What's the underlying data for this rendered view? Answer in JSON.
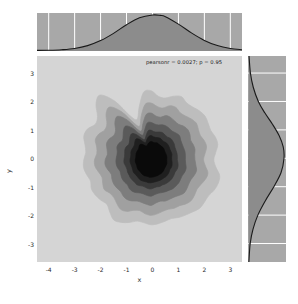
{
  "annotation": {
    "text": "pearsonr = 0.0027; p = 0.95",
    "pearson_r": 0.0027,
    "p_value": 0.95
  },
  "axis_titles": {
    "x": "x",
    "y": "y"
  },
  "watermark": {
    "text": ""
  },
  "colors": {
    "figure_background": "#ffffff",
    "axes_background": "#d5d5d5",
    "marginal_background": "#a8a8a8",
    "gridline": "#ffffff",
    "kde_line": "#1a1a1a",
    "kde_fill": "#8c8c8c",
    "tick_label": "#2b2b2b",
    "contour_levels": [
      "#d5d5d5",
      "#bdbdbd",
      "#a0a0a0",
      "#7d7d7d",
      "#5a5a5a",
      "#3a3a3a",
      "#1f1f1f",
      "#0a0a0a"
    ]
  },
  "chart_data": {
    "type": "contour",
    "title": "",
    "subtitle": "",
    "xlabel": "x",
    "ylabel": "y",
    "xlim": [
      -4.45,
      3.45
    ],
    "ylim": [
      -3.65,
      3.6
    ],
    "xticks": [
      -4,
      -3,
      -2,
      -1,
      0,
      1,
      2,
      3
    ],
    "xticklabels": [
      "-4",
      "-3",
      "-2",
      "-1",
      "0",
      "1",
      "2",
      "3"
    ],
    "yticks": [
      -3,
      -2,
      -1,
      0,
      1,
      2,
      3
    ],
    "yticklabels": [
      "-3",
      "-2",
      "-1",
      "0",
      "1",
      "2",
      "3"
    ],
    "grid": false,
    "legend": null,
    "annotations": [
      {
        "text": "pearsonr = 0.0027; p = 0.95",
        "x": 0.9,
        "y": 3.35,
        "halign": "center"
      }
    ],
    "joint": {
      "kind": "kde",
      "shade": true,
      "cmap": "Greys",
      "n_levels": 8,
      "center": {
        "x": -0.05,
        "y": -0.05
      },
      "contours": [
        {
          "level": 1,
          "color": "#bdbdbd",
          "radius_x": 2.55,
          "radius_y": 2.35,
          "lobes": [
            0.1,
            -0.06,
            0.12,
            -0.04,
            0.08,
            -0.1,
            0.06,
            -0.08,
            0.11,
            -0.05,
            0.09,
            -0.07
          ]
        },
        {
          "level": 2,
          "color": "#a0a0a0",
          "radius_x": 2.1,
          "radius_y": 1.95,
          "lobes": [
            0.09,
            -0.07,
            0.11,
            -0.05,
            0.07,
            -0.09,
            0.08,
            -0.06,
            0.1,
            -0.04,
            0.08,
            -0.08
          ]
        },
        {
          "level": 3,
          "color": "#7d7d7d",
          "radius_x": 1.7,
          "radius_y": 1.6,
          "lobes": [
            0.08,
            -0.06,
            0.1,
            -0.05,
            0.07,
            -0.08,
            0.09,
            -0.05,
            0.08,
            -0.06,
            0.07,
            -0.07
          ]
        },
        {
          "level": 4,
          "color": "#5a5a5a",
          "radius_x": 1.32,
          "radius_y": 1.28,
          "lobes": [
            0.07,
            -0.05,
            0.09,
            -0.04,
            0.06,
            -0.07,
            0.08,
            -0.05,
            0.07,
            -0.05,
            0.06,
            -0.06
          ]
        },
        {
          "level": 5,
          "color": "#3a3a3a",
          "radius_x": 1.02,
          "radius_y": 1.02,
          "lobes": [
            0.06,
            -0.05,
            0.08,
            -0.04,
            0.05,
            -0.06,
            0.07,
            -0.04,
            0.06,
            -0.05,
            0.05,
            -0.05
          ]
        },
        {
          "level": 6,
          "color": "#1f1f1f",
          "radius_x": 0.8,
          "radius_y": 0.82,
          "lobes": [
            0.05,
            -0.04,
            0.06,
            -0.03,
            0.05,
            -0.05,
            0.06,
            -0.04,
            0.05,
            -0.04,
            0.04,
            -0.05
          ]
        },
        {
          "level": 7,
          "color": "#0a0a0a",
          "radius_x": 0.6,
          "radius_y": 0.62,
          "lobes": [
            0.04,
            -0.03,
            0.05,
            -0.03,
            0.04,
            -0.04,
            0.05,
            -0.03,
            0.04,
            -0.03,
            0.04,
            -0.04
          ]
        }
      ]
    },
    "marginal_x": {
      "kind": "kde",
      "orientation": "horizontal",
      "xlim": [
        -4.45,
        3.45
      ],
      "mean": 0.02,
      "sigma": 1.02,
      "gridlines_at": [
        -4,
        -3,
        -2,
        -1,
        0,
        1,
        2,
        3
      ],
      "samples": [
        {
          "x": -4.45,
          "d": 0.001
        },
        {
          "x": -4.0,
          "d": 0.003
        },
        {
          "x": -3.5,
          "d": 0.01
        },
        {
          "x": -3.0,
          "d": 0.026
        },
        {
          "x": -2.5,
          "d": 0.063
        },
        {
          "x": -2.0,
          "d": 0.128
        },
        {
          "x": -1.5,
          "d": 0.222
        },
        {
          "x": -1.0,
          "d": 0.334
        },
        {
          "x": -0.5,
          "d": 0.424
        },
        {
          "x": 0.0,
          "d": 0.46
        },
        {
          "x": 0.3,
          "d": 0.455
        },
        {
          "x": 0.5,
          "d": 0.438
        },
        {
          "x": 1.0,
          "d": 0.342
        },
        {
          "x": 1.5,
          "d": 0.228
        },
        {
          "x": 2.0,
          "d": 0.131
        },
        {
          "x": 2.5,
          "d": 0.064
        },
        {
          "x": 3.0,
          "d": 0.027
        },
        {
          "x": 3.45,
          "d": 0.01
        }
      ]
    },
    "marginal_y": {
      "kind": "kde",
      "orientation": "vertical",
      "ylim": [
        -3.65,
        3.6
      ],
      "mean": -0.05,
      "sigma": 1.02,
      "gridlines_at": [
        -3,
        -2,
        -1,
        0,
        1,
        2,
        3
      ],
      "samples": [
        {
          "y": -3.65,
          "d": 0.005
        },
        {
          "y": -3.0,
          "d": 0.022
        },
        {
          "y": -2.5,
          "d": 0.058
        },
        {
          "y": -2.0,
          "d": 0.122
        },
        {
          "y": -1.5,
          "d": 0.218
        },
        {
          "y": -1.0,
          "d": 0.33
        },
        {
          "y": -0.5,
          "d": 0.424
        },
        {
          "y": 0.0,
          "d": 0.462
        },
        {
          "y": 0.4,
          "d": 0.452
        },
        {
          "y": 0.8,
          "d": 0.398
        },
        {
          "y": 1.2,
          "d": 0.312
        },
        {
          "y": 1.6,
          "d": 0.212
        },
        {
          "y": 2.0,
          "d": 0.128
        },
        {
          "y": 2.5,
          "d": 0.062
        },
        {
          "y": 3.0,
          "d": 0.025
        },
        {
          "y": 3.6,
          "d": 0.007
        }
      ]
    }
  }
}
